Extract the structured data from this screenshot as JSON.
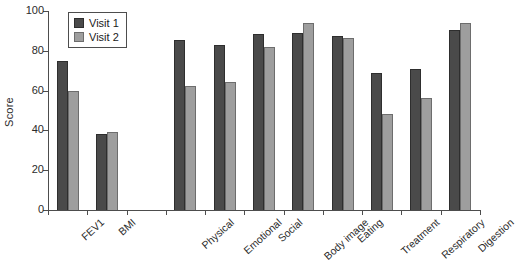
{
  "chart_data": {
    "type": "bar",
    "title": "",
    "subtitle": "",
    "xlabel": "",
    "ylabel": "Score",
    "ylim": [
      0,
      100
    ],
    "yticks": [
      0,
      20,
      40,
      60,
      80,
      100
    ],
    "grid": false,
    "legend_position": "top-left",
    "categories": [
      "FEV1",
      "BMI",
      "",
      "Physical",
      "Emotional",
      "Social",
      "Body image",
      "Eating",
      "Treatment",
      "Respiratory",
      "Digestion"
    ],
    "series": [
      {
        "name": "Visit 1",
        "color": "#4a4a4a",
        "values": [
          75,
          38,
          null,
          85.5,
          83,
          88.5,
          89,
          87.5,
          69,
          71,
          90.5
        ]
      },
      {
        "name": "Visit 2",
        "color": "#9e9e9e",
        "values": [
          60,
          39,
          null,
          62.5,
          64.5,
          82,
          94,
          86.5,
          48.5,
          56.5,
          94
        ]
      }
    ]
  },
  "legend": {
    "items": [
      {
        "label": "Visit 1",
        "swatch": "legend-swatch-visit-1"
      },
      {
        "label": "Visit 2",
        "swatch": "legend-swatch-visit-2"
      }
    ]
  },
  "axes": {
    "y": {
      "label": "Score",
      "tick_labels": [
        "0",
        "20",
        "40",
        "60",
        "80",
        "100"
      ]
    },
    "x": {
      "tick_labels": [
        "FEV1",
        "BMI",
        "",
        "Physical",
        "Emotional",
        "Social",
        "Body image",
        "Eating",
        "Treatment",
        "Respiratory",
        "Digestion"
      ]
    }
  },
  "colors": {
    "visit_1": "#4a4a4a",
    "visit_2": "#9e9e9e",
    "axis": "#4d4d4d",
    "background": "#ffffff"
  }
}
